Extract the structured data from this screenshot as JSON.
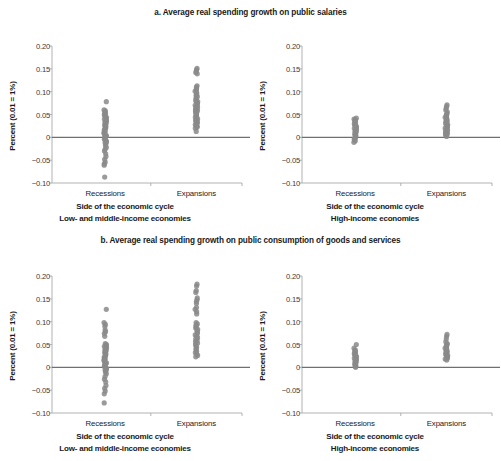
{
  "figure": {
    "panel_a_title": "a. Average real spending growth on public salaries",
    "panel_b_title": "b. Average real spending growth on public consumption of goods and services"
  },
  "axes": {
    "ylabel": "Percent (0.01 = 1%)",
    "yticks": [
      "0.20",
      "0.15",
      "0.10",
      "0.05",
      "0",
      "−0.05",
      "−0.10"
    ],
    "ytick_values": [
      0.2,
      0.15,
      0.1,
      0.05,
      0,
      -0.05,
      -0.1
    ],
    "xtick_recessions": "Recessions",
    "xtick_expansions": "Expansions",
    "xaxis_title": "Side of the economic cycle",
    "sub_lmic": "Low- and middle-income economies",
    "sub_hic": "High-income economies"
  },
  "style": {
    "dot_color": "#8a8a8a",
    "axis_color": "#a9a9a9",
    "zero_line_color": "#707070",
    "text_color": "#231f20",
    "background": "#ffffff"
  },
  "chart_data": [
    {
      "id": "a-left",
      "type": "scatter",
      "title": "a. Average real spending growth on public salaries",
      "subtitle": "Low- and middle-income economies",
      "xlabel": "Side of the economic cycle",
      "ylabel": "Percent (0.01 = 1%)",
      "categories": [
        "Recessions",
        "Expansions"
      ],
      "ylim": [
        -0.1,
        0.2
      ],
      "grid": false,
      "legend": "none",
      "zero_line": true,
      "series": [
        {
          "name": "Recessions",
          "values": [
            0.078,
            0.06,
            0.058,
            0.056,
            0.054,
            0.052,
            0.05,
            0.048,
            0.046,
            0.044,
            0.042,
            0.04,
            0.038,
            0.036,
            0.034,
            0.032,
            0.03,
            0.028,
            0.026,
            0.024,
            0.022,
            0.02,
            0.018,
            0.016,
            0.014,
            0.012,
            0.01,
            0.008,
            0.006,
            0.004,
            0.002,
            0.0,
            -0.002,
            -0.004,
            -0.006,
            -0.008,
            -0.01,
            -0.012,
            -0.014,
            -0.018,
            -0.022,
            -0.026,
            -0.03,
            -0.036,
            -0.042,
            -0.048,
            -0.054,
            -0.058,
            -0.061,
            -0.087
          ]
        },
        {
          "name": "Expansions",
          "values": [
            0.151,
            0.148,
            0.145,
            0.142,
            0.139,
            0.113,
            0.11,
            0.107,
            0.104,
            0.101,
            0.098,
            0.095,
            0.092,
            0.089,
            0.086,
            0.083,
            0.08,
            0.078,
            0.076,
            0.074,
            0.072,
            0.07,
            0.068,
            0.066,
            0.064,
            0.062,
            0.06,
            0.058,
            0.056,
            0.054,
            0.052,
            0.05,
            0.048,
            0.046,
            0.044,
            0.042,
            0.04,
            0.038,
            0.036,
            0.034,
            0.032,
            0.03,
            0.028,
            0.026,
            0.024,
            0.022,
            0.02,
            0.013
          ]
        }
      ]
    },
    {
      "id": "a-right",
      "type": "scatter",
      "title": "a. Average real spending growth on public salaries",
      "subtitle": "High-income economies",
      "xlabel": "Side of the economic cycle",
      "ylabel": "Percent (0.01 = 1%)",
      "categories": [
        "Recessions",
        "Expansions"
      ],
      "ylim": [
        -0.1,
        0.2
      ],
      "grid": false,
      "legend": "none",
      "zero_line": true,
      "series": [
        {
          "name": "Recessions",
          "values": [
            0.042,
            0.04,
            0.038,
            0.036,
            0.034,
            0.032,
            0.03,
            0.028,
            0.026,
            0.024,
            0.022,
            0.02,
            0.018,
            0.016,
            0.014,
            0.012,
            0.01,
            0.008,
            0.006,
            0.004,
            0.002,
            0.0,
            -0.002,
            -0.004,
            -0.006,
            -0.008,
            -0.011
          ]
        },
        {
          "name": "Expansions",
          "values": [
            0.071,
            0.068,
            0.064,
            0.06,
            0.056,
            0.052,
            0.05,
            0.048,
            0.046,
            0.044,
            0.042,
            0.04,
            0.038,
            0.036,
            0.034,
            0.032,
            0.03,
            0.028,
            0.026,
            0.024,
            0.022,
            0.02,
            0.018,
            0.016,
            0.014,
            0.012,
            0.01,
            0.008,
            0.006,
            0.004,
            0.002
          ]
        }
      ]
    },
    {
      "id": "b-left",
      "type": "scatter",
      "title": "b. Average real spending growth on public consumption of goods and services",
      "subtitle": "Low- and middle-income economies",
      "xlabel": "Side of the economic cycle",
      "ylabel": "Percent (0.01 = 1%)",
      "categories": [
        "Recessions",
        "Expansions"
      ],
      "ylim": [
        -0.1,
        0.2
      ],
      "grid": false,
      "legend": "none",
      "zero_line": true,
      "series": [
        {
          "name": "Recessions",
          "values": [
            0.127,
            0.098,
            0.094,
            0.09,
            0.082,
            0.078,
            0.074,
            0.068,
            0.052,
            0.05,
            0.048,
            0.046,
            0.044,
            0.042,
            0.04,
            0.038,
            0.036,
            0.034,
            0.032,
            0.03,
            0.028,
            0.026,
            0.024,
            0.022,
            0.02,
            0.018,
            0.016,
            0.014,
            0.012,
            0.01,
            0.008,
            0.006,
            0.004,
            0.002,
            0.0,
            -0.002,
            -0.004,
            -0.006,
            -0.008,
            -0.01,
            -0.014,
            -0.02,
            -0.026,
            -0.032,
            -0.04,
            -0.046,
            -0.052,
            -0.058,
            -0.078
          ]
        },
        {
          "name": "Expansions",
          "values": [
            0.182,
            0.178,
            0.168,
            0.164,
            0.152,
            0.148,
            0.144,
            0.14,
            0.131,
            0.127,
            0.122,
            0.117,
            0.098,
            0.095,
            0.092,
            0.089,
            0.086,
            0.083,
            0.08,
            0.077,
            0.074,
            0.071,
            0.068,
            0.065,
            0.062,
            0.059,
            0.056,
            0.053,
            0.05,
            0.047,
            0.044,
            0.041,
            0.038,
            0.035,
            0.032,
            0.029,
            0.026,
            0.023
          ]
        }
      ]
    },
    {
      "id": "b-right",
      "type": "scatter",
      "title": "b. Average real spending growth on public consumption of goods and services",
      "subtitle": "High-income economies",
      "xlabel": "Side of the economic cycle",
      "ylabel": "Percent (0.01 = 1%)",
      "categories": [
        "Recessions",
        "Expansions"
      ],
      "ylim": [
        -0.1,
        0.2
      ],
      "grid": false,
      "legend": "none",
      "zero_line": true,
      "series": [
        {
          "name": "Recessions",
          "values": [
            0.05,
            0.042,
            0.038,
            0.036,
            0.034,
            0.032,
            0.03,
            0.028,
            0.026,
            0.024,
            0.022,
            0.02,
            0.018,
            0.016,
            0.014,
            0.012,
            0.01,
            0.008,
            0.006,
            0.004,
            0.002,
            0.0
          ]
        },
        {
          "name": "Expansions",
          "values": [
            0.072,
            0.068,
            0.062,
            0.056,
            0.052,
            0.05,
            0.048,
            0.046,
            0.044,
            0.042,
            0.04,
            0.038,
            0.036,
            0.034,
            0.032,
            0.03,
            0.028,
            0.026,
            0.024,
            0.022,
            0.02,
            0.018,
            0.016
          ]
        }
      ]
    }
  ]
}
